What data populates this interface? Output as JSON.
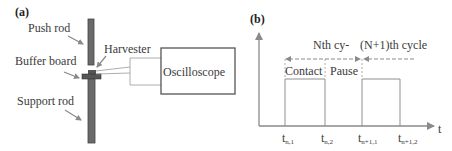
{
  "panel_a": {
    "label": "(a)",
    "components": {
      "push_rod": "Push rod",
      "buffer_board": "Buffer board",
      "support_rod": "Support rod",
      "harvester": "Harvester",
      "oscilloscope": "Oscilloscope"
    }
  },
  "panel_b": {
    "label": "(b)",
    "cycle_n": "Nth  cy-",
    "cycle_n1": "(N+1)th cycle",
    "phase_contact": "Contact",
    "phase_pause": "Pause",
    "axis_t": "t",
    "ticks": [
      {
        "main": "t",
        "sub": "n,1"
      },
      {
        "main": "t",
        "sub": "n,2"
      },
      {
        "main": "t",
        "sub": "n+1,1"
      },
      {
        "main": "t",
        "sub": "n+1,2"
      }
    ]
  },
  "colors": {
    "rod": "#5a5a5a",
    "axis": "#8a8a8a",
    "line": "#8f8f8f",
    "text": "#3a3a3a"
  }
}
